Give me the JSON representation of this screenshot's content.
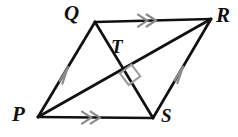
{
  "figure": {
    "kind": "geometry-diagram",
    "shape_name": "parallelogram PQRS with diagonals",
    "background_color": "#ffffff",
    "stroke_color": "#111111",
    "tick_mark_color": "#8a8a8a",
    "right_angle_color": "#9a9a9a",
    "stroke_width": 2.6,
    "width": 238,
    "height": 137
  },
  "labels": {
    "q": "Q",
    "r": "R",
    "t": "T",
    "p": "P",
    "s": "S"
  },
  "points": {
    "P": {
      "x": 38,
      "y": 117
    },
    "Q": {
      "x": 95,
      "y": 22
    },
    "R": {
      "x": 211,
      "y": 19
    },
    "S": {
      "x": 153,
      "y": 118
    },
    "T": {
      "x": 122,
      "y": 70
    }
  },
  "segments": [
    {
      "name": "side-PQ",
      "from": "P",
      "to": "Q",
      "marks": 1,
      "mark_type": "single-arrow"
    },
    {
      "name": "side-QR",
      "from": "Q",
      "to": "R",
      "marks": 2,
      "mark_type": "double-arrow"
    },
    {
      "name": "side-SR",
      "from": "S",
      "to": "R",
      "marks": 1,
      "mark_type": "single-arrow"
    },
    {
      "name": "side-PS",
      "from": "P",
      "to": "S",
      "marks": 2,
      "mark_type": "double-arrow"
    },
    {
      "name": "diagonal-PR",
      "from": "P",
      "to": "R",
      "marks": 0,
      "mark_type": "none"
    },
    {
      "name": "diagonal-QS",
      "from": "Q",
      "to": "S",
      "marks": 0,
      "mark_type": "none"
    }
  ],
  "angle_marks": [
    {
      "name": "right-angle-at-T",
      "vertex": "T",
      "type": "square",
      "measure_degrees": 90
    }
  ]
}
